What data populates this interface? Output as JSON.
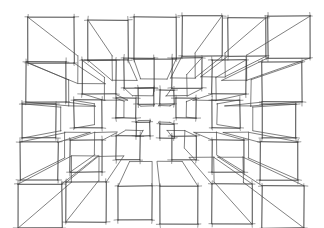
{
  "artwork": {
    "title": "One-Point Perspective Cube Grid",
    "medium": "pencil line drawing on white paper",
    "subject": "array of open wireframe cubes receding to a central vanishing point",
    "background_color": "#ffffff",
    "line_color": "#2b2b2b",
    "receding_line_color": "#4a4a4a",
    "canvas": {
      "width": 324,
      "height": 228
    },
    "vanishing_point": {
      "x": 152,
      "y": 114
    },
    "style": {
      "hand_drawn": true,
      "overshoot_ticks": true,
      "stroke_width": 0.75
    }
  },
  "cubes": [
    {
      "x": 28,
      "y": 17,
      "size": 46,
      "depth": 0.4,
      "faces": "front-left-bottom"
    },
    {
      "x": 88,
      "y": 20,
      "size": 40,
      "depth": 0.38,
      "faces": "front-left-bottom"
    },
    {
      "x": 134,
      "y": 17,
      "size": 42,
      "depth": 0.36,
      "faces": "front-bottom"
    },
    {
      "x": 182,
      "y": 16,
      "size": 40,
      "depth": 0.38,
      "faces": "front-right-bottom"
    },
    {
      "x": 228,
      "y": 18,
      "size": 38,
      "depth": 0.36,
      "faces": "front-right-bottom"
    },
    {
      "x": 268,
      "y": 16,
      "size": 42,
      "depth": 0.4,
      "faces": "front-right-bottom"
    },
    {
      "x": 26,
      "y": 62,
      "size": 40,
      "depth": 0.34,
      "faces": "front-left-bottom"
    },
    {
      "x": 82,
      "y": 60,
      "size": 34,
      "depth": 0.32,
      "faces": "front-left-bottom"
    },
    {
      "x": 124,
      "y": 58,
      "size": 30,
      "depth": 0.3,
      "faces": "front-bottom"
    },
    {
      "x": 172,
      "y": 58,
      "size": 30,
      "depth": 0.3,
      "faces": "front-right-bottom"
    },
    {
      "x": 212,
      "y": 60,
      "size": 34,
      "depth": 0.32,
      "faces": "front-right-bottom"
    },
    {
      "x": 262,
      "y": 62,
      "size": 40,
      "depth": 0.34,
      "faces": "front-right-bottom"
    },
    {
      "x": 22,
      "y": 104,
      "size": 34,
      "depth": 0.3,
      "faces": "front-left"
    },
    {
      "x": 74,
      "y": 100,
      "size": 28,
      "depth": 0.26,
      "faces": "front-left"
    },
    {
      "x": 116,
      "y": 98,
      "size": 20,
      "depth": 0.22,
      "faces": "front-left"
    },
    {
      "x": 176,
      "y": 98,
      "size": 20,
      "depth": 0.22,
      "faces": "front-right"
    },
    {
      "x": 212,
      "y": 100,
      "size": 28,
      "depth": 0.26,
      "faces": "front-right"
    },
    {
      "x": 262,
      "y": 104,
      "size": 34,
      "depth": 0.3,
      "faces": "front-right"
    },
    {
      "x": 20,
      "y": 142,
      "size": 38,
      "depth": 0.34,
      "faces": "front-left-top"
    },
    {
      "x": 70,
      "y": 140,
      "size": 32,
      "depth": 0.3,
      "faces": "front-left-top"
    },
    {
      "x": 116,
      "y": 136,
      "size": 24,
      "depth": 0.26,
      "faces": "front-top"
    },
    {
      "x": 172,
      "y": 136,
      "size": 24,
      "depth": 0.26,
      "faces": "front-right-top"
    },
    {
      "x": 212,
      "y": 140,
      "size": 32,
      "depth": 0.3,
      "faces": "front-right-top"
    },
    {
      "x": 260,
      "y": 142,
      "size": 38,
      "depth": 0.34,
      "faces": "front-right-top"
    },
    {
      "x": 18,
      "y": 184,
      "size": 44,
      "depth": 0.4,
      "faces": "front-left-top"
    },
    {
      "x": 66,
      "y": 182,
      "size": 40,
      "depth": 0.38,
      "faces": "front-left-top"
    },
    {
      "x": 118,
      "y": 186,
      "size": 34,
      "depth": 0.34,
      "faces": "front-top"
    },
    {
      "x": 160,
      "y": 186,
      "size": 38,
      "depth": 0.34,
      "faces": "front-top"
    },
    {
      "x": 212,
      "y": 184,
      "size": 40,
      "depth": 0.38,
      "faces": "front-right-top"
    },
    {
      "x": 262,
      "y": 186,
      "size": 42,
      "depth": 0.4,
      "faces": "front-right-top"
    }
  ],
  "inner_cubes": [
    {
      "x": 138,
      "y": 88,
      "size": 16,
      "depth": 0.2,
      "faces": "front-bottom"
    },
    {
      "x": 160,
      "y": 90,
      "size": 14,
      "depth": 0.18,
      "faces": "front-bottom"
    },
    {
      "x": 136,
      "y": 122,
      "size": 14,
      "depth": 0.18,
      "faces": "front-top"
    },
    {
      "x": 160,
      "y": 124,
      "size": 14,
      "depth": 0.18,
      "faces": "front-top"
    }
  ]
}
